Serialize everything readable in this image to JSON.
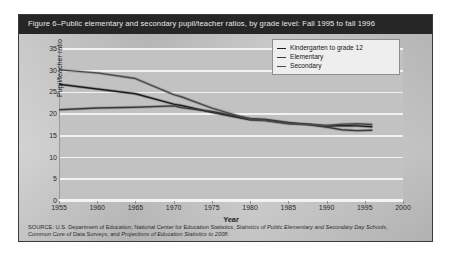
{
  "figure": {
    "title": "Figure 6–Public elementary and secondary pupil/teacher ratios, by grade level: Fall 1995 to fall 1996",
    "border_color": "#3b3b3b",
    "title_bar_color": "#262626",
    "plot_bg_color": "#c2c2c2",
    "gridline_color": "#f2f2f2"
  },
  "legend": {
    "position": "top-right",
    "items": [
      {
        "label": "Kindergarten to grade 12",
        "color": "#1d1d1d"
      },
      {
        "label": "Elementary",
        "color": "#3a3a3a"
      },
      {
        "label": "Secondary",
        "color": "#4a4a4a"
      }
    ]
  },
  "source": {
    "line1_prefix": "SOURCE: U.S. Department of Education, National Center for Education Statistics, ",
    "line1_italic": "Statistics of Public Elementary and Secondary Day Schools",
    "line1_suffix": ",",
    "line2_prefix": "Common Core of Data Surveys, and ",
    "line2_italic": "Projections of Education Statistics to 2008",
    "line2_suffix": "."
  },
  "chart_data": {
    "type": "line",
    "title": "Figure 6–Public elementary and secondary pupil/teacher ratios, by grade level: Fall 1995 to fall 1996",
    "xlabel": "Year",
    "ylabel": "Pupil/teacher ratio",
    "xlim": [
      1955,
      2000
    ],
    "ylim": [
      0,
      35
    ],
    "xticks": [
      1955,
      1960,
      1965,
      1970,
      1975,
      1980,
      1985,
      1990,
      1995,
      2000
    ],
    "yticks": [
      0,
      5,
      10,
      15,
      20,
      25,
      30,
      35
    ],
    "grid": true,
    "legend_position": "top-right",
    "x": [
      1955,
      1960,
      1965,
      1970,
      1971,
      1975,
      1980,
      1982,
      1985,
      1988,
      1990,
      1992,
      1994,
      1996
    ],
    "series": [
      {
        "name": "Kindergarten to grade 12",
        "color": "#1d1d1d",
        "values": [
          26.9,
          25.8,
          24.7,
          22.3,
          22.0,
          20.4,
          18.7,
          18.6,
          17.9,
          17.6,
          17.2,
          17.4,
          17.3,
          17.1
        ]
      },
      {
        "name": "Elementary",
        "color": "#3a3a3a",
        "values": [
          21.0,
          21.4,
          21.6,
          21.9,
          21.5,
          20.6,
          19.0,
          18.8,
          18.1,
          17.5,
          17.0,
          16.4,
          16.2,
          16.3
        ]
      },
      {
        "name": "Secondary",
        "color": "#4a4a4a",
        "values": [
          30.2,
          29.5,
          28.2,
          24.5,
          24.0,
          21.4,
          18.8,
          18.5,
          17.8,
          17.6,
          17.4,
          17.7,
          17.8,
          17.6
        ]
      }
    ]
  }
}
